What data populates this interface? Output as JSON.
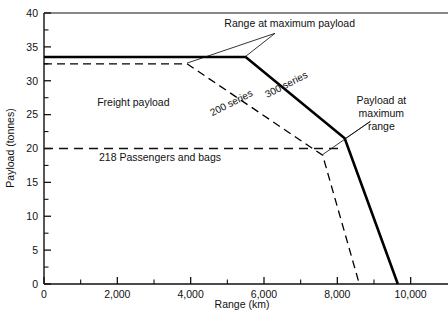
{
  "chart_data": {
    "type": "line",
    "title": "",
    "xlabel": "Range (km)",
    "ylabel": "Payload (tonnes)",
    "xlim": [
      0,
      10800
    ],
    "ylim": [
      0,
      40
    ],
    "grid": false,
    "legend_position": "inline-annotations",
    "x_ticks_major": [
      0,
      2000,
      4000,
      6000,
      8000,
      10000
    ],
    "x_tick_labels": [
      "0",
      "2,000",
      "4,000",
      "6,000",
      "8,000",
      "10,000"
    ],
    "x_ticks_minor": [
      1000,
      3000,
      5000,
      7000,
      9000
    ],
    "y_ticks_major": [
      0,
      5,
      10,
      15,
      20,
      25,
      30,
      35,
      40
    ],
    "y_tick_labels": [
      "0",
      "5",
      "10",
      "15",
      "20",
      "25",
      "30",
      "35",
      "40"
    ],
    "y_ticks_minor": [
      2.5,
      7.5,
      12.5,
      17.5,
      22.5,
      27.5,
      32.5,
      37.5
    ],
    "series": [
      {
        "name": "300 series",
        "style": "solid",
        "width": 2.6,
        "color": "#000000",
        "points": [
          {
            "x": 0,
            "y": 33.5
          },
          {
            "x": 5500,
            "y": 33.5
          },
          {
            "x": 8200,
            "y": 21.5
          },
          {
            "x": 9650,
            "y": 0
          }
        ]
      },
      {
        "name": "200 series",
        "style": "dashed",
        "width": 1.3,
        "color": "#000000",
        "points": [
          {
            "x": 0,
            "y": 32.5
          },
          {
            "x": 3900,
            "y": 32.5
          },
          {
            "x": 7600,
            "y": 19.0
          },
          {
            "x": 8600,
            "y": 0
          }
        ]
      }
    ],
    "reference_lines": [
      {
        "name": "218 Passengers and bags",
        "orientation": "horizontal",
        "value": 20,
        "style": "dashed",
        "x_start": 0,
        "x_end": 8050
      }
    ],
    "region_labels": [
      {
        "text": "Freight payload",
        "x": 1450,
        "y": 26.2
      }
    ],
    "inline_series_labels": [
      {
        "text": "300 series",
        "x": 6650,
        "y": 29.0,
        "rotation": -27
      },
      {
        "text": "200 series",
        "x": 5150,
        "y": 26.3,
        "rotation": -27
      }
    ],
    "reference_line_labels": [
      {
        "text": "218 Passengers and bags",
        "x": 1500,
        "y": 18.1
      }
    ],
    "annotations": [
      {
        "name": "range-at-maximum-payload",
        "text": "Range at maximum payload",
        "text_x": 6700,
        "text_y": 38.0,
        "leaders": [
          {
            "from_x": 6300,
            "from_y": 37.0,
            "to_x": 5500,
            "to_y": 33.6
          },
          {
            "from_x": 6300,
            "from_y": 37.0,
            "to_x": 3900,
            "to_y": 32.6
          }
        ]
      },
      {
        "name": "payload-at-maximum-range",
        "text_lines": [
          "Payload  at",
          "maximum",
          "range"
        ],
        "text_x": 9200,
        "text_y": 26.5,
        "leaders": [
          {
            "from_x": 8900,
            "from_y": 24.0,
            "to_x": 8200,
            "to_y": 21.4
          },
          {
            "from_x": 8900,
            "from_y": 24.0,
            "to_x": 7600,
            "to_y": 19.1
          }
        ]
      }
    ]
  },
  "figure": {
    "background_color": "#ffffff",
    "axis_color": "#111111",
    "plot_left_px": 44,
    "plot_right_px": 440,
    "plot_top_px": 13,
    "plot_bottom_px": 284
  }
}
